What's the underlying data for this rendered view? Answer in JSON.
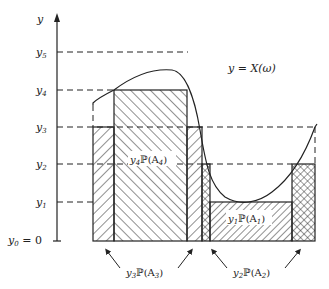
{
  "diagram": {
    "axis_label": "y",
    "levels": [
      {
        "name": "y5",
        "label": "y",
        "sub": "5"
      },
      {
        "name": "y4",
        "label": "y",
        "sub": "4"
      },
      {
        "name": "y3",
        "label": "y",
        "sub": "3"
      },
      {
        "name": "y2",
        "label": "y",
        "sub": "2"
      },
      {
        "name": "y1",
        "label": "y",
        "sub": "1"
      },
      {
        "name": "y0",
        "label": "y",
        "sub": "0",
        "suffix": " = 0"
      }
    ],
    "curve_label": "y = X(ω)",
    "regions": {
      "a4": {
        "pre": "y",
        "sub": "4",
        "mid": "ℙ(A",
        "sub2": "4",
        "post": ")"
      },
      "a1": {
        "pre": "y",
        "sub": "1",
        "mid": "ℙ(A",
        "sub2": "1",
        "post": ")"
      },
      "a3": {
        "pre": "y",
        "sub": "3",
        "mid": "ℙ(A",
        "sub2": "3",
        "post": ")"
      },
      "a2": {
        "pre": "y",
        "sub": "2",
        "mid": "ℙ(A",
        "sub2": "2",
        "post": ")"
      }
    }
  }
}
